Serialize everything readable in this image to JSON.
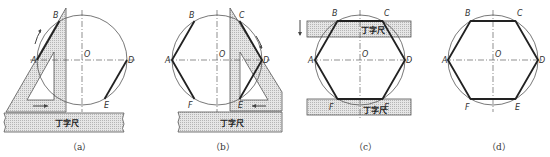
{
  "figure": {
    "type": "technical-drawing",
    "ruler_label": "丁字尺",
    "colors": {
      "ink": "#222222",
      "line": "#555555",
      "fill_dots": "#bdbdbd"
    }
  },
  "panels": [
    {
      "id": "a",
      "caption": "（a）",
      "points": {
        "A": "A",
        "B": "B",
        "O": "O",
        "D": "D",
        "E": "E"
      },
      "ruler_label": "丁字尺",
      "description": "Set square against T-square; draw AB and DE along 60° edge"
    },
    {
      "id": "b",
      "caption": "（b）",
      "points": {
        "A": "A",
        "B": "B",
        "C": "C",
        "O": "O",
        "D": "D",
        "E": "E",
        "F": "F"
      },
      "ruler_label": "丁字尺",
      "description": "Flip set square; draw CD and AF"
    },
    {
      "id": "c",
      "caption": "（c）",
      "points": {
        "A": "A",
        "B": "B",
        "C": "C",
        "O": "O",
        "D": "D",
        "E": "E",
        "F": "F"
      },
      "ruler_labels": [
        "丁字尺",
        "丁字尺"
      ],
      "description": "Use T-square to draw horizontal edges BC and FE"
    },
    {
      "id": "d",
      "caption": "（d）",
      "points": {
        "A": "A",
        "B": "B",
        "C": "C",
        "O": "O",
        "D": "D",
        "E": "E",
        "F": "F"
      },
      "description": "Completed regular hexagon ABCDEF"
    }
  ]
}
